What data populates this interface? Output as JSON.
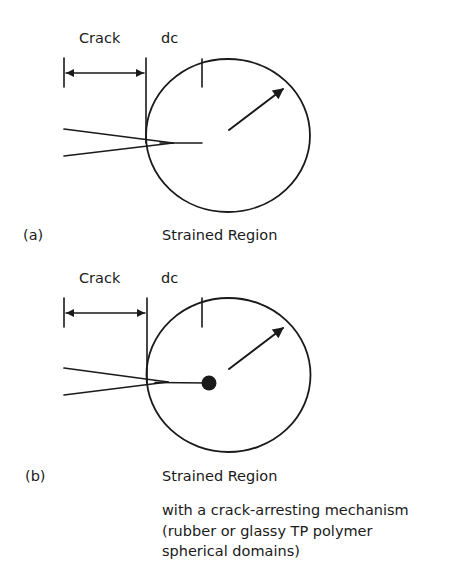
{
  "colors": {
    "ink": "#1a1a1a",
    "background": "#ffffff"
  },
  "panel_a": {
    "label": "(a)",
    "crack_label": "Crack",
    "dc_label": "dc",
    "region_label": "Strained Region"
  },
  "panel_b": {
    "label": "(b)",
    "crack_label": "Crack",
    "dc_label": "dc",
    "region_label": "Strained Region",
    "description": [
      "with a crack-arresting mechanism",
      "(rubber or glassy TP polymer",
      "spherical domains)"
    ]
  }
}
